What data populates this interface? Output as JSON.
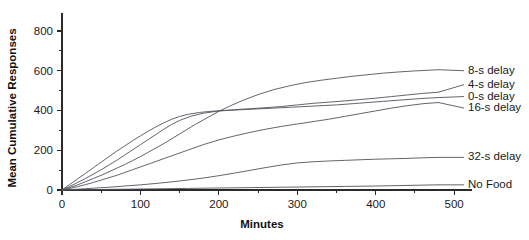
{
  "chart_data": {
    "type": "line",
    "title": "",
    "xlabel": "Minutes",
    "ylabel": "Mean Cumulative Responses",
    "xlim": [
      0,
      510
    ],
    "ylim": [
      0,
      830
    ],
    "xticks": [
      0,
      100,
      200,
      300,
      400,
      500
    ],
    "yticks": [
      0,
      200,
      400,
      600,
      800
    ],
    "xtick_labels": [
      "0",
      "100",
      "200",
      "300",
      "400",
      "500"
    ],
    "ytick_labels": [
      "0",
      "200",
      "400",
      "600",
      "800"
    ],
    "minor_yticks": [
      100,
      300,
      500,
      700
    ],
    "minor_xticks": [
      50,
      150,
      250,
      350,
      450
    ],
    "grid": false,
    "legend_position": "right-inline-labels",
    "line_color": "#50545a",
    "axis_color": "#2b2b2b",
    "series": [
      {
        "name": "8-s delay",
        "label": "8-s delay",
        "x": [
          0,
          10,
          20,
          30,
          40,
          50,
          60,
          70,
          80,
          90,
          100,
          110,
          120,
          130,
          140,
          150,
          160,
          170,
          180,
          190,
          200,
          215,
          230,
          250,
          270,
          290,
          310,
          330,
          350,
          370,
          390,
          410,
          430,
          450,
          470,
          480
        ],
        "values": [
          0,
          12,
          26,
          42,
          58,
          74,
          92,
          110,
          128,
          148,
          168,
          190,
          212,
          234,
          258,
          282,
          306,
          330,
          352,
          374,
          396,
          424,
          450,
          480,
          505,
          524,
          540,
          552,
          562,
          572,
          580,
          588,
          594,
          599,
          603,
          605
        ]
      },
      {
        "name": "4-s delay",
        "label": "4-s delay",
        "x": [
          0,
          10,
          20,
          30,
          40,
          50,
          60,
          70,
          80,
          90,
          100,
          110,
          120,
          130,
          140,
          150,
          165,
          180,
          200,
          220,
          240,
          260,
          280,
          300,
          320,
          340,
          360,
          380,
          400,
          420,
          440,
          460,
          480
        ],
        "values": [
          0,
          18,
          38,
          58,
          80,
          102,
          126,
          150,
          176,
          202,
          228,
          254,
          280,
          306,
          330,
          350,
          372,
          386,
          398,
          404,
          409,
          414,
          420,
          428,
          436,
          442,
          448,
          455,
          462,
          470,
          478,
          486,
          492
        ]
      },
      {
        "name": "0-s delay",
        "label": "0-s delay",
        "x": [
          0,
          10,
          20,
          30,
          40,
          50,
          60,
          70,
          80,
          90,
          100,
          110,
          120,
          130,
          140,
          150,
          160,
          175,
          190,
          210,
          230,
          250,
          270,
          290,
          310,
          330,
          350,
          370,
          390,
          410,
          430,
          450,
          470,
          480
        ],
        "values": [
          0,
          28,
          56,
          84,
          112,
          140,
          168,
          196,
          222,
          248,
          272,
          296,
          318,
          338,
          356,
          370,
          380,
          390,
          396,
          400,
          404,
          408,
          412,
          416,
          420,
          424,
          428,
          434,
          440,
          446,
          452,
          458,
          463,
          465
        ]
      },
      {
        "name": "16-s delay",
        "label": "16-s delay",
        "x": [
          0,
          10,
          20,
          30,
          40,
          50,
          60,
          70,
          80,
          90,
          100,
          120,
          140,
          160,
          180,
          200,
          220,
          240,
          260,
          280,
          300,
          320,
          340,
          360,
          380,
          400,
          420,
          440,
          460,
          480
        ],
        "values": [
          0,
          8,
          17,
          27,
          38,
          50,
          62,
          74,
          88,
          102,
          116,
          144,
          172,
          200,
          228,
          252,
          272,
          290,
          306,
          320,
          332,
          344,
          356,
          370,
          384,
          398,
          412,
          424,
          434,
          440
        ]
      },
      {
        "name": "32-s delay",
        "label": "32-s delay",
        "x": [
          0,
          20,
          40,
          60,
          80,
          100,
          120,
          140,
          160,
          180,
          200,
          220,
          240,
          260,
          280,
          300,
          320,
          340,
          360,
          380,
          400,
          420,
          440,
          460,
          480
        ],
        "values": [
          0,
          4,
          9,
          14,
          20,
          26,
          33,
          41,
          50,
          60,
          72,
          85,
          99,
          113,
          126,
          136,
          142,
          146,
          149,
          152,
          155,
          157,
          159,
          162,
          164
        ]
      },
      {
        "name": "No Food",
        "label": "No Food",
        "x": [
          0,
          40,
          80,
          120,
          160,
          200,
          240,
          280,
          320,
          360,
          400,
          440,
          480
        ],
        "values": [
          0,
          2,
          4,
          6,
          8,
          10,
          12,
          14,
          16,
          18,
          20,
          23,
          26
        ]
      }
    ],
    "label_anchors": [
      {
        "name": "8-s delay",
        "x": 480,
        "y": 605,
        "label_y": 600
      },
      {
        "name": "4-s delay",
        "x": 480,
        "y": 492,
        "label_y": 530
      },
      {
        "name": "0-s delay",
        "x": 480,
        "y": 465,
        "label_y": 470
      },
      {
        "name": "16-s delay",
        "x": 480,
        "y": 440,
        "label_y": 412
      },
      {
        "name": "32-s delay",
        "x": 480,
        "y": 164,
        "label_y": 164
      },
      {
        "name": "No Food",
        "x": 480,
        "y": 26,
        "label_y": 26
      }
    ]
  }
}
